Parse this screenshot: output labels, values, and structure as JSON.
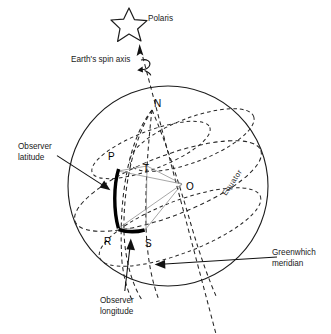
{
  "figure": {
    "background_color": "#ffffff",
    "line_color": "#1c1c1c",
    "highlight_color": "#000000",
    "thin_line_color": "#8a8a8a"
  },
  "labels": {
    "polaris": "Polaris",
    "spin_axis": "Earth's spin axis",
    "observer_latitude_line1": "Observer",
    "observer_latitude_line2": "latitude",
    "observer_longitude_line1": "Observer",
    "observer_longitude_line2": "longitude",
    "greenwich_line1": "Greenwhich",
    "greenwich_line2": "meridian",
    "equator": "Equator"
  },
  "points": {
    "north_pole": "N",
    "observer_p": "P",
    "point_t": "T",
    "center_o": "O",
    "point_r": "R",
    "point_s": "S"
  },
  "icons": {
    "star": "polaris-star-icon",
    "axis_arrow": "axis-arrow-icon",
    "rotation_arrow": "rotation-curved-arrow-icon"
  }
}
